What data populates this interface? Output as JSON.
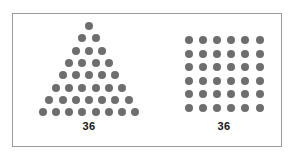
{
  "figures": [
    {
      "name": "triangular-arrangement",
      "label": "36",
      "total": 36,
      "shape": "triangle",
      "rows": [
        1,
        2,
        3,
        4,
        5,
        6,
        7,
        8
      ],
      "dot_color": "#6e6e6e"
    },
    {
      "name": "square-grid-arrangement",
      "label": "36",
      "total": 36,
      "shape": "grid",
      "grid_rows": 6,
      "grid_cols": 6,
      "dot_color": "#6e6e6e"
    }
  ],
  "frame": {
    "border_color": "#9a9a9a",
    "background": "#ffffff"
  }
}
